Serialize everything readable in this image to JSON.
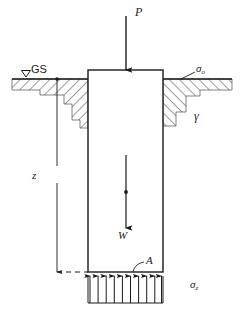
{
  "figure": {
    "domain": "engineering-diagram",
    "width": 242,
    "height": 309,
    "background": "#ffffff",
    "line_color": "#1a1a1a",
    "hatch_color": "#4d4d4d"
  },
  "labels": {
    "load": "P",
    "ground_surface": "GS",
    "surcharge": "σ",
    "surcharge_sub": "o",
    "unit_weight": "γ",
    "depth": "z",
    "weight": "W",
    "area": "A",
    "base_pressure": "σ",
    "base_pressure_sub": "z"
  },
  "geometry": {
    "shaft": {
      "left": 88,
      "right": 163,
      "top": 70,
      "bottom": 272
    },
    "ground_line_y": 79,
    "base_pressure_box": {
      "left": 88,
      "right": 163,
      "top": 276,
      "bottom": 303
    },
    "pressure_arrow_count": 10,
    "dimension_line_x": 57,
    "dimension_top_y": 79,
    "dimension_bottom_y": 272
  },
  "annotations": {
    "load_arrow": {
      "x": 126,
      "y_from": 16,
      "y_to": 70,
      "direction": "down"
    },
    "weight_arrow": {
      "x": 126,
      "y_from": 155,
      "y_to": 228,
      "direction": "down",
      "midpoint_dot_y": 192
    },
    "ground_surface_marker": "open-triangle",
    "surcharge_leader": {
      "from_x": 194,
      "from_y": 72,
      "to_x": 181,
      "to_y": 79
    },
    "area_leader": {
      "from_x": 144,
      "from_y": 260,
      "to_x": 134,
      "to_y": 272
    }
  }
}
